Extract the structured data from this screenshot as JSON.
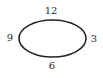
{
  "diagram": {
    "shape": "ellipse",
    "stroke_color": "#222222",
    "labels": {
      "top": "12",
      "right": "3",
      "bottom": "6",
      "left": "9"
    }
  }
}
